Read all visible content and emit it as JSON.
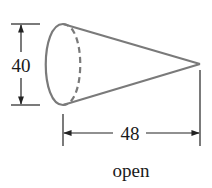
{
  "figure": {
    "type": "cone",
    "caption": "open",
    "dimensions": {
      "diameter": {
        "value": "40",
        "orientation": "vertical"
      },
      "height": {
        "value": "48",
        "orientation": "horizontal"
      }
    },
    "colors": {
      "shape_stroke": "#7a7a7a",
      "dimension_stroke": "#222222",
      "text": "#1a1a1a",
      "background": "#ffffff"
    }
  }
}
